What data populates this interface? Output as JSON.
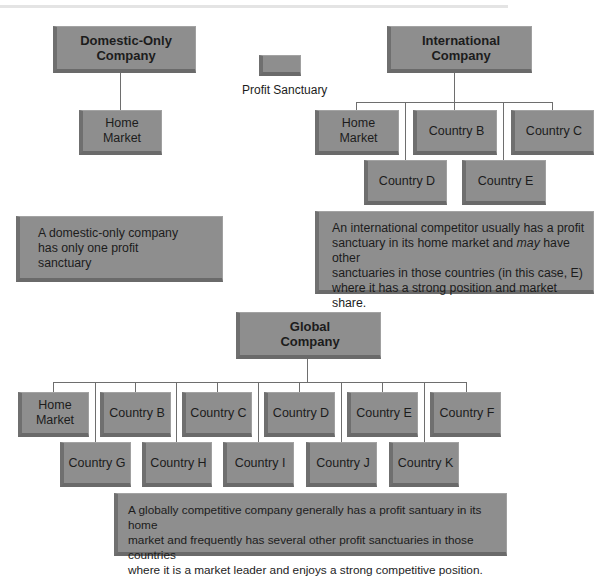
{
  "legend": {
    "label": "Profit Sanctuary"
  },
  "domestic": {
    "title": "Domestic-Only\nCompany",
    "children": [
      "Home\nMarket"
    ],
    "description": "A domestic-only company\nhas only one profit\nsanctuary"
  },
  "international": {
    "title": "International\nCompany",
    "row1": [
      "Home\nMarket",
      "Country B",
      "Country C"
    ],
    "row2": [
      "Country D",
      "Country E"
    ],
    "description_pre": "An international competitor usually has a profit\nsanctuary in its home market and ",
    "description_em": "may",
    "description_post": " have other\nsanctuaries in those countries (in this case, E)\nwhere it has a strong position and market share."
  },
  "global": {
    "title": "Global\nCompany",
    "row1": [
      "Home\nMarket",
      "Country B",
      "Country C",
      "Country D",
      "Country E",
      "Country F"
    ],
    "row2": [
      "Country G",
      "Country H",
      "Country I",
      "Country J",
      "Country K"
    ],
    "description": "A globally competitive company generally has a profit santuary in its home\nmarket and frequently has several other profit sanctuaries in those countries\nwhere it is a market leader and enjoys a strong competitive position."
  },
  "colors": {
    "box_fill": "#8e8e8e",
    "box_shadow": "#6a6a6a",
    "connector": "#6e6e6e"
  }
}
